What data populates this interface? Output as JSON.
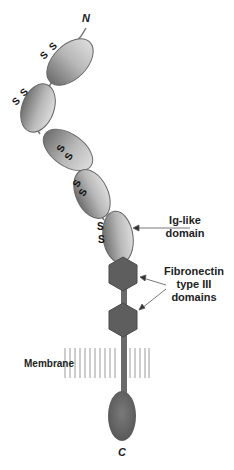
{
  "diagram": {
    "type": "protein-domain-structure",
    "terminals": {
      "n": "N",
      "c": "C"
    },
    "disulfide_label": "S",
    "labels": {
      "ig_like": [
        "Ig-like",
        "domain"
      ],
      "fibronectin": [
        "Fibronectin",
        "type III",
        "domains"
      ],
      "membrane": "Membrane"
    },
    "domains": {
      "ig_like_count": 5,
      "fibronectin_type_iii_count": 2
    },
    "colors": {
      "domain_light": "#d8d8d8",
      "domain_dark": "#6e6e6e",
      "hexagon": "#5e5e5e",
      "stem": "#6a6a6a",
      "membrane_lines": "#9a9a9a",
      "text": "#222222"
    }
  }
}
